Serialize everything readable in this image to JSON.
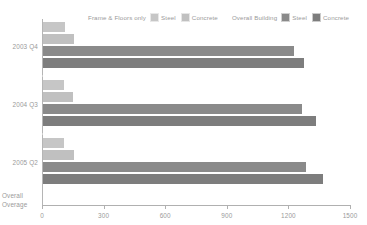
{
  "chart_data": {
    "type": "bar",
    "orientation": "horizontal",
    "title": "",
    "xlabel": "",
    "ylabel": "",
    "categories": [
      "2003 Q4",
      "2004 Q3",
      "2005 Q2"
    ],
    "series": [
      {
        "name": "Steel",
        "group": "Frame & Floors only",
        "color": "#c6c6c6",
        "values": [
          107,
          101,
          102
        ]
      },
      {
        "name": "Concrete",
        "group": "Frame & Floors only",
        "color": "#c0c0c0",
        "values": [
          151,
          148,
          150
        ]
      },
      {
        "name": "Steel",
        "group": "Overall Building",
        "color": "#8a8a8a",
        "values": [
          1224,
          1260,
          1283
        ]
      },
      {
        "name": "Concrete",
        "group": "Overall Building",
        "color": "#7d7d7d",
        "values": [
          1273,
          1330,
          1366
        ]
      }
    ],
    "xlim": [
      0,
      1500
    ],
    "xticks": [
      0,
      300,
      600,
      900,
      1200,
      1500
    ],
    "xtick_labels": [
      "0",
      "300",
      "600",
      "900",
      "1200",
      "1500"
    ],
    "grid": false,
    "legend_position": "top"
  },
  "legend": {
    "group1_title": "Frame & Floors only",
    "group1_items": [
      {
        "label": "Steel",
        "color": "#c6c6c6"
      },
      {
        "label": "Concrete",
        "color": "#c0c0c0"
      }
    ],
    "group2_title": "Overall Building",
    "group2_items": [
      {
        "label": "Steel",
        "color": "#8a8a8a"
      },
      {
        "label": "Concrete",
        "color": "#7d7d7d"
      }
    ]
  },
  "axis": {
    "corner_label_line1": "Overall",
    "corner_label_line2": "Overage"
  }
}
